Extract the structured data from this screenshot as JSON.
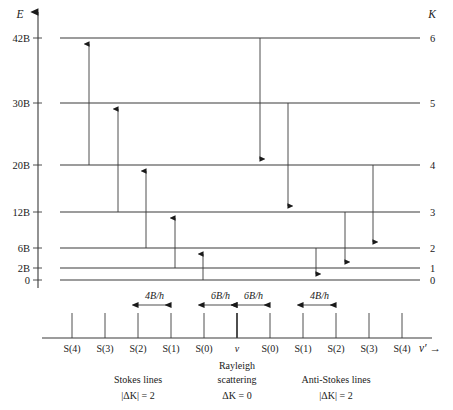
{
  "figure": {
    "axes": {
      "energy_label": "E",
      "k_label": "K",
      "frequency_label": "ν′ →"
    },
    "colors": {
      "line": "#3a3a3a",
      "text": "#1a1a1a",
      "background": "#ffffff"
    },
    "levels": [
      {
        "energy_label": "42B",
        "k_label": "6",
        "energy_value": 42,
        "k": 6,
        "y": 38
      },
      {
        "energy_label": "30B",
        "k_label": "5",
        "energy_value": 30,
        "k": 5,
        "y": 103
      },
      {
        "energy_label": "20B",
        "k_label": "4",
        "energy_value": 20,
        "k": 4,
        "y": 165
      },
      {
        "energy_label": "12B",
        "k_label": "3",
        "energy_value": 12,
        "k": 3,
        "y": 212
      },
      {
        "energy_label": "6B",
        "k_label": "2",
        "energy_value": 6,
        "k": 2,
        "y": 248
      },
      {
        "energy_label": "2B",
        "k_label": "1",
        "energy_value": 2,
        "k": 1,
        "y": 268
      },
      {
        "energy_label": "0",
        "k_label": "0",
        "energy_value": 0,
        "k": 0,
        "y": 280
      }
    ],
    "stokes_transitions": [
      {
        "name": "S(4)",
        "from_k": 4,
        "to_k": 6,
        "x": 89,
        "y_start": 165,
        "y_end": 38
      },
      {
        "name": "S(3)",
        "from_k": 3,
        "to_k": 5,
        "x": 118,
        "y_start": 212,
        "y_end": 103
      },
      {
        "name": "S(2)",
        "from_k": 2,
        "to_k": 4,
        "x": 146,
        "y_start": 248,
        "y_end": 165
      },
      {
        "name": "S(1)",
        "from_k": 1,
        "to_k": 3,
        "x": 175,
        "y_start": 268,
        "y_end": 212
      },
      {
        "name": "S(0)",
        "from_k": 0,
        "to_k": 2,
        "x": 203,
        "y_start": 280,
        "y_end": 248
      }
    ],
    "antistokes_transitions": [
      {
        "name": "S(0)",
        "from_k": 2,
        "to_k": 0,
        "x": 316,
        "y_start": 248,
        "y_end": 280
      },
      {
        "name": "S(1)",
        "from_k": 3,
        "to_k": 1,
        "x": 345,
        "y_start": 212,
        "y_end": 268
      },
      {
        "name": "S(2)",
        "from_k": 4,
        "to_k": 2,
        "x": 373,
        "y_start": 165,
        "y_end": 248
      },
      {
        "name": "S(3)",
        "from_k": 5,
        "to_k": 3,
        "x": 288,
        "y_start": 103,
        "y_end": 212
      },
      {
        "name": "S(4)",
        "from_k": 6,
        "to_k": 4,
        "x": 260,
        "y_start": 38,
        "y_end": 165
      }
    ],
    "spectrum": {
      "axis_y": 338,
      "tick_top": 313,
      "lines": [
        {
          "label": "S(4)",
          "x": 72,
          "group": "stokes"
        },
        {
          "label": "S(3)",
          "x": 105,
          "group": "stokes"
        },
        {
          "label": "S(2)",
          "x": 138,
          "group": "stokes"
        },
        {
          "label": "S(1)",
          "x": 171,
          "group": "stokes"
        },
        {
          "label": "S(0)",
          "x": 204,
          "group": "stokes"
        },
        {
          "label": "ν",
          "x": 237,
          "group": "rayleigh"
        },
        {
          "label": "S(0)",
          "x": 270,
          "group": "antistokes"
        },
        {
          "label": "S(1)",
          "x": 303,
          "group": "antistokes"
        },
        {
          "label": "S(2)",
          "x": 336,
          "group": "antistokes"
        },
        {
          "label": "S(3)",
          "x": 369,
          "group": "antistokes"
        },
        {
          "label": "S(4)",
          "x": 402,
          "group": "antistokes"
        }
      ],
      "spacings": [
        {
          "label": "4B/h",
          "x1": 138,
          "x2": 171,
          "y": 305
        },
        {
          "label": "6B/h",
          "x1": 204,
          "x2": 237,
          "y": 305
        },
        {
          "label": "6B/h",
          "x1": 237,
          "x2": 270,
          "y": 305
        },
        {
          "label": "4B/h",
          "x1": 303,
          "x2": 336,
          "y": 305
        }
      ]
    },
    "captions": [
      {
        "line1": "Stokes lines",
        "line2": "|ΔK| = 2",
        "x": 138
      },
      {
        "line1": "Rayleigh",
        "line2": "ΔK = 0",
        "x": 237,
        "line0": "scattering"
      },
      {
        "line1": "Anti-Stokes lines",
        "line2": "|ΔK| = 2",
        "x": 336
      }
    ],
    "caption_rows": {
      "stokes_title": "Stokes lines",
      "stokes_rule": "|ΔK| = 2",
      "rayleigh_title1": "Rayleigh",
      "rayleigh_title2": "scattering",
      "rayleigh_rule": "ΔK = 0",
      "antistokes_title": "Anti-Stokes lines",
      "antistokes_rule": "|ΔK| = 2"
    }
  }
}
